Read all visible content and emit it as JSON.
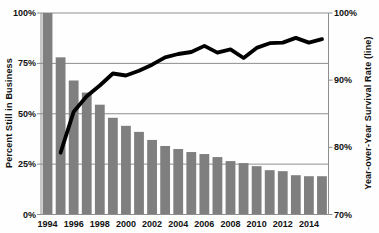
{
  "chart_data": {
    "type": "bar+line combo",
    "x": [
      1994,
      1995,
      1996,
      1997,
      1998,
      1999,
      2000,
      2001,
      2002,
      2003,
      2004,
      2005,
      2006,
      2007,
      2008,
      2009,
      2010,
      2011,
      2012,
      2013,
      2014,
      2015
    ],
    "series": [
      {
        "name": "Percent Still in Business",
        "type": "bar",
        "axis": "left",
        "values": [
          100,
          78,
          66.5,
          60.5,
          54.5,
          48,
          44,
          41,
          37,
          34,
          32.5,
          31,
          30,
          28.5,
          26.5,
          25.5,
          24,
          22,
          21.5,
          19.5,
          19,
          19
        ]
      },
      {
        "name": "Year-over-Year Survival Rate",
        "type": "line",
        "axis": "right",
        "values": [
          null,
          79.2,
          85.3,
          87.6,
          89.2,
          91.0,
          90.7,
          91.4,
          92.3,
          93.4,
          93.9,
          94.2,
          95.1,
          94.1,
          94.6,
          93.3,
          94.8,
          95.5,
          95.6,
          96.3,
          95.6,
          96.1
        ]
      }
    ],
    "left_axis": {
      "label": "Percent Still in Business",
      "min": 0,
      "max": 100,
      "tick_values": [
        0,
        25,
        50,
        75,
        100
      ],
      "tick_labels": [
        "0%",
        "25%",
        "50%",
        "75%",
        "100%"
      ]
    },
    "right_axis": {
      "label": "Year-over-Year Survival Rate (line)",
      "min": 70,
      "max": 100,
      "tick_values": [
        70,
        80,
        90,
        100
      ],
      "tick_labels": [
        "70%",
        "80%",
        "90%",
        "100%"
      ]
    },
    "x_axis": {
      "labeled_years": [
        "1994",
        "1996",
        "1998",
        "2000",
        "2002",
        "2004",
        "2006",
        "2008",
        "2010",
        "2012",
        "2014"
      ]
    },
    "grid": "horizontal gridlines at 25/50/75/100 (left axis)",
    "legend": "none",
    "title": "",
    "colors": {
      "bar": "#7f7f7f",
      "line": "#000000",
      "grid": "#8e8e8e",
      "spine": "#8e8e8e",
      "text": "#111111",
      "background": "#fefefe"
    }
  }
}
